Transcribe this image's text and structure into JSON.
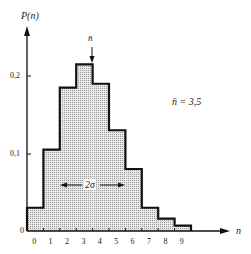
{
  "chart_data": {
    "type": "bar",
    "title": "",
    "xlabel": "n",
    "ylabel": "P(n)",
    "categories": [
      "0",
      "1",
      "2",
      "3",
      "4",
      "5",
      "6",
      "7",
      "8",
      "9"
    ],
    "values": [
      0.03,
      0.105,
      0.185,
      0.215,
      0.19,
      0.13,
      0.08,
      0.03,
      0.016,
      0.007
    ],
    "ylim": [
      0,
      0.25
    ],
    "yticks": [
      "0",
      "0,1",
      "0,2"
    ],
    "grid": false,
    "legend": null,
    "annotations": {
      "mean_marker": "n̄",
      "mean_text": "n̄ = 3,5",
      "width_label": "2σ"
    }
  }
}
